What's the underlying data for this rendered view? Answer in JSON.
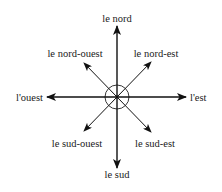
{
  "diagram": {
    "type": "compass-rose",
    "language": "French",
    "center": {
      "x": 117,
      "y": 97
    },
    "circle_radius": 12,
    "colors": {
      "line": "#111111",
      "text": "#1a1a1a",
      "background": "#ffffff"
    },
    "directions": {
      "north": {
        "label": "le nord"
      },
      "south": {
        "label": "le sud"
      },
      "east": {
        "label": "l'est"
      },
      "west": {
        "label": "l'ouest"
      },
      "northeast": {
        "label": "le nord-est"
      },
      "northwest": {
        "label": "le nord-ouest"
      },
      "southeast": {
        "label": "le sud-est"
      },
      "southwest": {
        "label": "le sud-ouest"
      }
    }
  }
}
